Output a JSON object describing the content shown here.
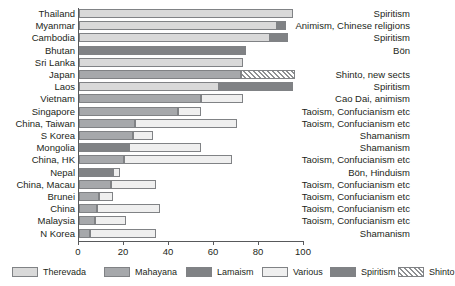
{
  "chart_data": {
    "type": "bar",
    "orientation": "horizontal",
    "stacked": true,
    "title": "",
    "xlabel": "",
    "ylabel": "",
    "xlim": [
      0,
      100
    ],
    "xticks": [
      0,
      20,
      40,
      60,
      80,
      100
    ],
    "grid": false,
    "legend_position": "bottom",
    "categories": [
      "Thailand",
      "Myanmar",
      "Cambodia",
      "Bhutan",
      "Sri Lanka",
      "Japan",
      "Laos",
      "Vietnam",
      "Singapore",
      "China, Taiwan",
      "S Korea",
      "Mongolia",
      "China, HK",
      "Nepal",
      "China, Macau",
      "Brunei",
      "China",
      "Malaysia",
      "N Korea"
    ],
    "series": [
      {
        "name": "Therevada",
        "color": "#d9d9d9",
        "values": [
          95,
          88,
          85,
          0,
          73,
          0,
          62,
          0,
          0,
          0,
          0,
          0,
          0,
          0,
          0,
          0,
          0,
          0,
          0
        ]
      },
      {
        "name": "Mahayana",
        "color": "#a6a8ab",
        "values": [
          0,
          0,
          0,
          0,
          0,
          72,
          0,
          54,
          44,
          25,
          24,
          0,
          20,
          0,
          14,
          9,
          8,
          7,
          5
        ]
      },
      {
        "name": "Lamaism",
        "color": "#808285",
        "values": [
          0,
          0,
          0,
          74,
          0,
          0,
          0,
          0,
          0,
          0,
          0,
          22,
          0,
          15,
          0,
          0,
          0,
          0,
          0
        ]
      },
      {
        "name": "Various",
        "color": "#efefef",
        "values": [
          0,
          0,
          0,
          0,
          0,
          0,
          0,
          19,
          10,
          45,
          9,
          32,
          48,
          3,
          20,
          6,
          28,
          14,
          29
        ]
      },
      {
        "name": "Spiritism",
        "color": "#808285",
        "values": [
          0,
          4,
          8,
          0,
          0,
          0,
          33,
          0,
          0,
          0,
          0,
          0,
          0,
          0,
          0,
          0,
          0,
          0,
          0
        ]
      },
      {
        "name": "Shinto",
        "color": "hatch",
        "values": [
          0,
          0,
          0,
          0,
          0,
          24,
          0,
          0,
          0,
          0,
          0,
          0,
          0,
          0,
          0,
          0,
          0,
          0,
          0
        ]
      }
    ],
    "annotations": [
      "Spiritism",
      "Animism, Chinese religions",
      "Spiritism",
      "Bön",
      "",
      "Shinto, new sects",
      "Spiritism",
      "Cao Dai, animism",
      "Taoism, Confucianism etc",
      "Taoism, Confucianism etc",
      "Shamanism",
      "Shamanism",
      "Taoism, Confucianism etc",
      "Bön, Hinduism",
      "Taoism, Confucianism etc",
      "Taoism, Confucianism etc",
      "Taoism, Confucianism etc",
      "Taoism, Confucianism etc",
      "Shamanism"
    ]
  },
  "legend": {
    "items": [
      {
        "label": "Therevada",
        "swatch": "s-therevada"
      },
      {
        "label": "Mahayana",
        "swatch": "s-mahayana"
      },
      {
        "label": "Lamaism",
        "swatch": "s-lamaism"
      },
      {
        "label": "Various",
        "swatch": "s-various"
      },
      {
        "label": "Spiritism",
        "swatch": "s-spiritism"
      },
      {
        "label": "Shinto",
        "swatch": "s-shinto"
      }
    ]
  },
  "axis": {
    "tick_labels": [
      "0",
      "20",
      "40",
      "60",
      "80",
      "100"
    ]
  },
  "colors": {
    "therevada": "#d9d9d9",
    "mahayana": "#a6a8ab",
    "lamaism": "#808285",
    "various": "#efefef",
    "spiritism": "#808285",
    "axis": "#58595b",
    "text": "#231f20",
    "bar_stroke": "#808285"
  }
}
